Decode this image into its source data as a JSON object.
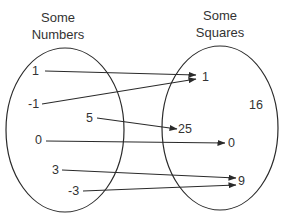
{
  "diagram": {
    "type": "mapping-diagram",
    "domain_set": {
      "title_line1": "Some",
      "title_line2": "Numbers",
      "elements": [
        "1",
        "-1",
        "5",
        "0",
        "3",
        "-3"
      ]
    },
    "codomain_set": {
      "title_line1": "Some",
      "title_line2": "Squares",
      "elements": [
        "1",
        "16",
        "25",
        "0",
        "9"
      ]
    },
    "mappings": [
      {
        "from": "1",
        "to": "1"
      },
      {
        "from": "-1",
        "to": "1"
      },
      {
        "from": "5",
        "to": "25"
      },
      {
        "from": "0",
        "to": "0"
      },
      {
        "from": "3",
        "to": "9"
      },
      {
        "from": "-3",
        "to": "9"
      }
    ],
    "colors": {
      "stroke": "#2a2a2a",
      "background": "#ffffff"
    }
  }
}
